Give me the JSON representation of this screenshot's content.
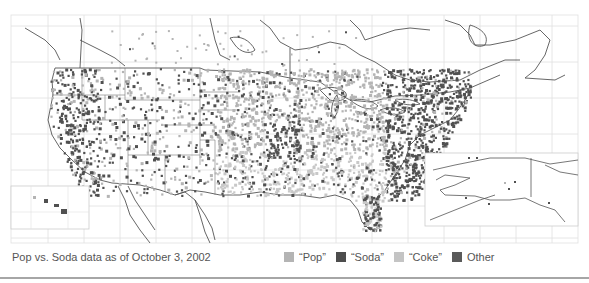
{
  "map": {
    "title": "Pop vs. Soda",
    "caption": "Pop vs. Soda data as of October 3, 2002",
    "regions": [
      "Contiguous United States",
      "Canada (southern)",
      "Mexico (northern)",
      "Alaska inset",
      "Hawaii inset"
    ],
    "colors": {
      "pop": "#b4b4b4",
      "soda": "#505050",
      "coke": "#c8c8c8",
      "other": "#5a5a5a",
      "coastline": "#555555",
      "grid": "#dcdcdc"
    },
    "dominant_by_region": {
      "West Coast": "Soda",
      "Midwest / Great Plains": "Pop",
      "St. Louis area": "Soda",
      "South": "Coke",
      "Northeast": "Soda",
      "Florida (south)": "Soda"
    }
  },
  "legend": {
    "items": [
      {
        "label": "“Pop”",
        "color": "#b4b4b4"
      },
      {
        "label": "“Soda”",
        "color": "#4d4d4d"
      },
      {
        "label": "“Coke”",
        "color": "#c4c4c4"
      },
      {
        "label": "Other",
        "color": "#5a5a5a"
      }
    ]
  }
}
